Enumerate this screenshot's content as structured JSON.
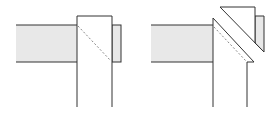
{
  "colors": {
    "stroke": "#333333",
    "fill_shaded": "#e8e8e8",
    "fill_white": "#ffffff",
    "dashed": "#888888",
    "background": "#ffffff"
  },
  "figures": [
    {
      "name": "left-figure",
      "description": "beam meeting post, mitre hidden line"
    },
    {
      "name": "right-figure",
      "description": "beam meeting post with cut-away mitred cap"
    }
  ]
}
